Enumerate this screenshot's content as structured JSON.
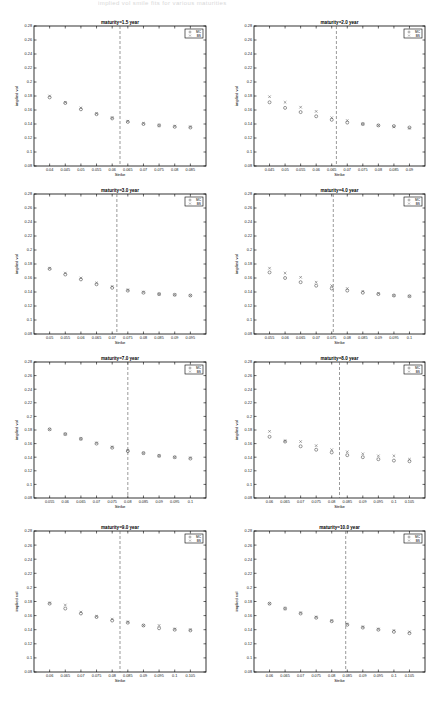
{
  "page": {
    "header_text": "implied vol smile fits for various maturities",
    "layout": {
      "columns": 2,
      "rows": 4
    }
  },
  "chart_data": [
    {
      "type": "scatter",
      "title": "maturity=1.5 year",
      "xlabel": "Strike",
      "ylabel": "implied vol",
      "ylim": [
        0.08,
        0.28
      ],
      "yticks": [
        0.08,
        0.1,
        0.12,
        0.14,
        0.16,
        0.18,
        0.2,
        0.22,
        0.24,
        0.26,
        0.28
      ],
      "xticks": [
        "0.04",
        "0.045",
        "0.05",
        "0.055",
        "0.06",
        "0.065",
        "0.07",
        "0.075",
        "0.08",
        "0.085"
      ],
      "x": [
        0.04,
        0.045,
        0.05,
        0.055,
        0.06,
        0.065,
        0.07,
        0.075,
        0.08,
        0.085
      ],
      "xlim": [
        0.035,
        0.09
      ],
      "atm_strike": 0.0625,
      "grid": false,
      "legend_position": "upper right",
      "series": [
        {
          "name": "MC",
          "marker": "o",
          "values": [
            0.178,
            0.17,
            0.161,
            0.154,
            0.148,
            0.143,
            0.14,
            0.138,
            0.136,
            0.135
          ]
        },
        {
          "name": "BS",
          "marker": "x",
          "values": [
            0.18,
            0.171,
            0.163,
            0.155,
            0.149,
            0.144,
            0.141,
            0.138,
            0.137,
            0.136
          ]
        }
      ]
    },
    {
      "type": "scatter",
      "title": "maturity=2.0 year",
      "xlabel": "Strike",
      "ylabel": "implied vol",
      "ylim": [
        0.08,
        0.28
      ],
      "yticks": [
        0.08,
        0.1,
        0.12,
        0.14,
        0.16,
        0.18,
        0.2,
        0.22,
        0.24,
        0.26,
        0.28
      ],
      "xticks": [
        "0.045",
        "0.05",
        "0.055",
        "0.06",
        "0.065",
        "0.07",
        "0.075",
        "0.08",
        "0.085",
        "0.09"
      ],
      "x": [
        0.045,
        0.05,
        0.055,
        0.06,
        0.065,
        0.07,
        0.075,
        0.08,
        0.085,
        0.09
      ],
      "xlim": [
        0.04,
        0.095
      ],
      "atm_strike": 0.0665,
      "grid": false,
      "legend_position": "upper right",
      "series": [
        {
          "name": "MC",
          "marker": "o",
          "values": [
            0.171,
            0.163,
            0.157,
            0.151,
            0.146,
            0.142,
            0.14,
            0.138,
            0.137,
            0.135
          ]
        },
        {
          "name": "BS",
          "marker": "x",
          "values": [
            0.179,
            0.171,
            0.164,
            0.158,
            0.149,
            0.145,
            0.14,
            0.138,
            0.136,
            0.134
          ]
        }
      ]
    },
    {
      "type": "scatter",
      "title": "maturity=3.0 year",
      "xlabel": "Strike",
      "ylabel": "implied vol",
      "ylim": [
        0.08,
        0.28
      ],
      "yticks": [
        0.08,
        0.1,
        0.12,
        0.14,
        0.16,
        0.18,
        0.2,
        0.22,
        0.24,
        0.26,
        0.28
      ],
      "xticks": [
        "0.05",
        "0.055",
        "0.06",
        "0.065",
        "0.07",
        "0.075",
        "0.08",
        "0.085",
        "0.09",
        "0.095"
      ],
      "x": [
        0.05,
        0.055,
        0.06,
        0.065,
        0.07,
        0.075,
        0.08,
        0.085,
        0.09,
        0.095
      ],
      "xlim": [
        0.045,
        0.1
      ],
      "atm_strike": 0.0715,
      "grid": false,
      "legend_position": "upper right",
      "series": [
        {
          "name": "MC",
          "marker": "o",
          "values": [
            0.173,
            0.165,
            0.158,
            0.151,
            0.146,
            0.142,
            0.139,
            0.137,
            0.136,
            0.135
          ]
        },
        {
          "name": "BS",
          "marker": "x",
          "values": [
            0.174,
            0.167,
            0.16,
            0.153,
            0.148,
            0.143,
            0.14,
            0.137,
            0.136,
            0.135
          ]
        }
      ]
    },
    {
      "type": "scatter",
      "title": "maturity=4.0 year",
      "xlabel": "Strike",
      "ylabel": "implied vol",
      "ylim": [
        0.08,
        0.28
      ],
      "yticks": [
        0.08,
        0.1,
        0.12,
        0.14,
        0.16,
        0.18,
        0.2,
        0.22,
        0.24,
        0.26,
        0.28
      ],
      "xticks": [
        "0.055",
        "0.06",
        "0.065",
        "0.07",
        "0.075",
        "0.08",
        "0.085",
        "0.09",
        "0.095",
        "0.1"
      ],
      "x": [
        0.055,
        0.06,
        0.065,
        0.07,
        0.075,
        0.08,
        0.085,
        0.09,
        0.095,
        0.1
      ],
      "xlim": [
        0.05,
        0.105
      ],
      "atm_strike": 0.0755,
      "grid": false,
      "legend_position": "upper right",
      "series": [
        {
          "name": "MC",
          "marker": "o",
          "values": [
            0.168,
            0.16,
            0.154,
            0.149,
            0.145,
            0.142,
            0.139,
            0.137,
            0.135,
            0.134
          ]
        },
        {
          "name": "BS",
          "marker": "x",
          "values": [
            0.174,
            0.167,
            0.161,
            0.154,
            0.149,
            0.145,
            0.141,
            0.138,
            0.135,
            0.134
          ]
        }
      ]
    },
    {
      "type": "scatter",
      "title": "maturity=7.0 year",
      "xlabel": "Strike",
      "ylabel": "implied vol",
      "ylim": [
        0.08,
        0.28
      ],
      "yticks": [
        0.08,
        0.1,
        0.12,
        0.14,
        0.16,
        0.18,
        0.2,
        0.22,
        0.24,
        0.26,
        0.28
      ],
      "xticks": [
        "0.055",
        "0.06",
        "0.065",
        "0.07",
        "0.075",
        "0.08",
        "0.085",
        "0.09",
        "0.095",
        "0.1"
      ],
      "x": [
        0.055,
        0.06,
        0.065,
        0.07,
        0.075,
        0.08,
        0.085,
        0.09,
        0.095,
        0.1
      ],
      "xlim": [
        0.05,
        0.105
      ],
      "atm_strike": 0.08,
      "grid": false,
      "legend_position": "upper right",
      "series": [
        {
          "name": "MC",
          "marker": "o",
          "values": [
            0.181,
            0.174,
            0.167,
            0.16,
            0.154,
            0.149,
            0.146,
            0.142,
            0.14,
            0.138
          ]
        },
        {
          "name": "BS",
          "marker": "x",
          "values": [
            0.181,
            0.174,
            0.167,
            0.161,
            0.155,
            0.15,
            0.146,
            0.142,
            0.14,
            0.139
          ]
        }
      ]
    },
    {
      "type": "scatter",
      "title": "maturity=8.0 year",
      "xlabel": "Strike",
      "ylabel": "implied vol",
      "ylim": [
        0.08,
        0.28
      ],
      "yticks": [
        0.08,
        0.1,
        0.12,
        0.14,
        0.16,
        0.18,
        0.2,
        0.22,
        0.24,
        0.26,
        0.28
      ],
      "xticks": [
        "0.06",
        "0.065",
        "0.07",
        "0.075",
        "0.08",
        "0.085",
        "0.09",
        "0.095",
        "0.1",
        "0.105"
      ],
      "x": [
        0.06,
        0.065,
        0.07,
        0.075,
        0.08,
        0.085,
        0.09,
        0.095,
        0.1,
        0.105
      ],
      "xlim": [
        0.055,
        0.11
      ],
      "atm_strike": 0.0825,
      "grid": false,
      "legend_position": "upper right",
      "series": [
        {
          "name": "MC",
          "marker": "o",
          "values": [
            0.17,
            0.163,
            0.156,
            0.151,
            0.147,
            0.143,
            0.14,
            0.137,
            0.135,
            0.134
          ]
        },
        {
          "name": "BS",
          "marker": "x",
          "values": [
            0.178,
            0.164,
            0.163,
            0.157,
            0.151,
            0.148,
            0.145,
            0.142,
            0.142,
            0.137
          ]
        }
      ]
    },
    {
      "type": "scatter",
      "title": "maturity=9.0 year",
      "xlabel": "Strike",
      "ylabel": "implied vol",
      "ylim": [
        0.08,
        0.28
      ],
      "yticks": [
        0.08,
        0.1,
        0.12,
        0.14,
        0.16,
        0.18,
        0.2,
        0.22,
        0.24,
        0.26,
        0.28
      ],
      "xticks": [
        "0.06",
        "0.065",
        "0.07",
        "0.075",
        "0.08",
        "0.085",
        "0.09",
        "0.095",
        "0.1",
        "0.105"
      ],
      "x": [
        0.06,
        0.065,
        0.07,
        0.075,
        0.08,
        0.085,
        0.09,
        0.095,
        0.1,
        0.105
      ],
      "xlim": [
        0.055,
        0.11
      ],
      "atm_strike": 0.0825,
      "grid": false,
      "legend_position": "upper right",
      "series": [
        {
          "name": "MC",
          "marker": "o",
          "values": [
            0.177,
            0.17,
            0.163,
            0.158,
            0.153,
            0.15,
            0.146,
            0.142,
            0.14,
            0.139
          ]
        },
        {
          "name": "BS",
          "marker": "x",
          "values": [
            0.178,
            0.175,
            0.165,
            0.159,
            0.155,
            0.151,
            0.146,
            0.146,
            0.141,
            0.14
          ]
        }
      ]
    },
    {
      "type": "scatter",
      "title": "maturity=10.0 year",
      "xlabel": "Strike",
      "ylabel": "implied vol",
      "ylim": [
        0.08,
        0.28
      ],
      "yticks": [
        0.08,
        0.1,
        0.12,
        0.14,
        0.16,
        0.18,
        0.2,
        0.22,
        0.24,
        0.26,
        0.28
      ],
      "xticks": [
        "0.06",
        "0.065",
        "0.07",
        "0.075",
        "0.08",
        "0.085",
        "0.09",
        "0.095",
        "0.1",
        "0.105"
      ],
      "x": [
        0.06,
        0.065,
        0.07,
        0.075,
        0.08,
        0.085,
        0.09,
        0.095,
        0.1,
        0.105
      ],
      "xlim": [
        0.055,
        0.11
      ],
      "atm_strike": 0.0845,
      "grid": false,
      "legend_position": "upper right",
      "series": [
        {
          "name": "MC",
          "marker": "o",
          "values": [
            0.177,
            0.17,
            0.163,
            0.157,
            0.152,
            0.147,
            0.143,
            0.14,
            0.137,
            0.135
          ]
        },
        {
          "name": "BS",
          "marker": "x",
          "values": [
            0.177,
            0.17,
            0.164,
            0.158,
            0.153,
            0.148,
            0.144,
            0.141,
            0.139,
            0.137
          ]
        }
      ]
    }
  ],
  "panels": [
    {
      "left": 6,
      "top": 16,
      "plot": {
        "x": 28,
        "y": 10,
        "w": 172,
        "h": 140
      }
    },
    {
      "left": 226,
      "top": 16,
      "plot": {
        "x": 28,
        "y": 10,
        "w": 171,
        "h": 140
      }
    },
    {
      "left": 6,
      "top": 184,
      "plot": {
        "x": 28,
        "y": 10,
        "w": 172,
        "h": 140
      }
    },
    {
      "left": 226,
      "top": 184,
      "plot": {
        "x": 28,
        "y": 10,
        "w": 171,
        "h": 140
      }
    },
    {
      "left": 6,
      "top": 352,
      "plot": {
        "x": 28,
        "y": 10,
        "w": 172,
        "h": 136
      }
    },
    {
      "left": 226,
      "top": 352,
      "plot": {
        "x": 28,
        "y": 10,
        "w": 171,
        "h": 136
      }
    },
    {
      "left": 6,
      "top": 521,
      "plot": {
        "x": 28,
        "y": 10,
        "w": 172,
        "h": 141
      }
    },
    {
      "left": 226,
      "top": 521,
      "plot": {
        "x": 28,
        "y": 10,
        "w": 171,
        "h": 141
      }
    }
  ]
}
